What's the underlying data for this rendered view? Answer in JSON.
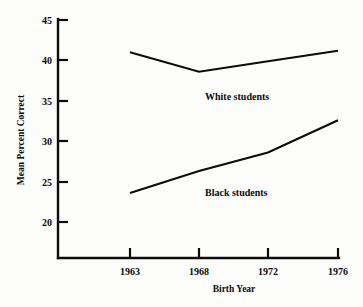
{
  "chart_data": {
    "type": "line",
    "title": "",
    "xlabel": "Birth Year",
    "ylabel": "Mean Percent Correct",
    "x": [
      1963,
      1968,
      1972,
      1976
    ],
    "categories": [
      "1963",
      "1968",
      "1972",
      "1976"
    ],
    "xtick_labels": [
      "1963",
      "1968",
      "1972",
      "1976"
    ],
    "ytick_labels": [
      "20",
      "25",
      "30",
      "35",
      "40",
      "45"
    ],
    "yticks": [
      20,
      25,
      30,
      35,
      40,
      45
    ],
    "ylim": [
      16.5,
      45
    ],
    "xlim": [
      1960.5,
      1977.5
    ],
    "grid": false,
    "legend_position": "inline-annotation",
    "series": [
      {
        "name": "White students",
        "label": "White students",
        "values": [
          41.0,
          38.6,
          39.9,
          41.2
        ],
        "color": "#0b0b0b"
      },
      {
        "name": "Black students",
        "label": "Black students",
        "values": [
          23.6,
          26.3,
          28.6,
          32.6
        ],
        "color": "#0b0b0b"
      }
    ],
    "annotations": [
      {
        "text": "White students",
        "x": 1969.6,
        "y": 36.6
      },
      {
        "text": "Black students",
        "x": 1969.6,
        "y": 24.6
      }
    ]
  }
}
